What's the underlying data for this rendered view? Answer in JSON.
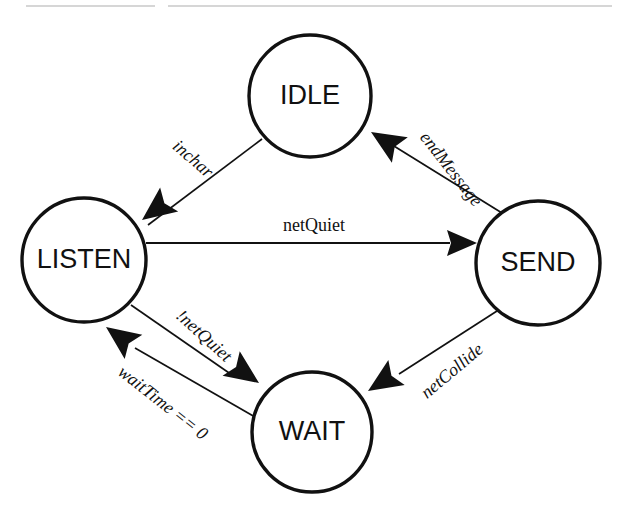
{
  "diagram": {
    "type": "finite-state-machine",
    "colors": {
      "stroke": "#111111",
      "fill": "#ffffff",
      "background": "#ffffff",
      "rule": "#c8c8c8"
    },
    "canvas": {
      "width": 627,
      "height": 517
    },
    "rules": [
      {
        "name": "top-rule-left",
        "x1": 26,
        "y1": 6,
        "x2": 155,
        "y2": 6
      },
      {
        "name": "top-rule-right",
        "x1": 168,
        "y1": 6,
        "x2": 612,
        "y2": 6
      }
    ],
    "states": [
      {
        "id": "idle",
        "label": "IDLE",
        "cx": 310,
        "cy": 96,
        "r": 61,
        "font_size": 27
      },
      {
        "id": "listen",
        "label": "LISTEN",
        "cx": 84,
        "cy": 260,
        "r": 62,
        "font_size": 27
      },
      {
        "id": "send",
        "label": "SEND",
        "cx": 538,
        "cy": 263,
        "r": 62,
        "font_size": 27
      },
      {
        "id": "wait",
        "label": "WAIT",
        "cx": 312,
        "cy": 432,
        "r": 60,
        "font_size": 27
      }
    ],
    "transitions": [
      {
        "id": "idle-to-listen",
        "from": "IDLE",
        "to": "LISTEN",
        "label": "inchar",
        "label_x": 192,
        "label_y": 160,
        "label_rotation": 41,
        "label_italic": true,
        "font_size": 18,
        "x1": 262,
        "y1": 139,
        "x2": 148,
        "y2": 225,
        "tip_x": 142,
        "tip_y": 220,
        "tip_angle": 143
      },
      {
        "id": "send-to-idle",
        "from": "SEND",
        "to": "IDLE",
        "label": "endMessage",
        "label_x": 450,
        "label_y": 170,
        "label_rotation": 52,
        "label_italic": true,
        "font_size": 18,
        "x1": 502,
        "y1": 213,
        "x2": 381,
        "y2": 138,
        "tip_x": 371,
        "tip_y": 132,
        "tip_angle": 212
      },
      {
        "id": "listen-to-send",
        "from": "LISTEN",
        "to": "SEND",
        "label": "netQuiet",
        "label_x": 314,
        "label_y": 227,
        "label_rotation": 0,
        "label_italic": false,
        "font_size": 18,
        "x1": 146,
        "y1": 243,
        "x2": 450,
        "y2": 243,
        "tip_x": 477,
        "tip_y": 243,
        "tip_angle": 0
      },
      {
        "id": "listen-to-wait",
        "from": "LISTEN",
        "to": "WAIT",
        "label": "!netQuiet",
        "label_x": 203,
        "label_y": 337,
        "label_rotation": 42,
        "label_italic": true,
        "font_size": 18,
        "x1": 131,
        "y1": 305,
        "x2": 232,
        "y2": 375,
        "tip_x": 259,
        "tip_y": 383,
        "tip_angle": 35
      },
      {
        "id": "send-to-wait",
        "from": "SEND",
        "to": "WAIT",
        "label": "netCollide",
        "label_x": 453,
        "label_y": 372,
        "label_rotation": -40,
        "label_italic": true,
        "font_size": 18,
        "x1": 497,
        "y1": 311,
        "x2": 399,
        "y2": 374,
        "tip_x": 368,
        "tip_y": 391,
        "tip_angle": 147
      },
      {
        "id": "wait-to-listen",
        "from": "WAIT",
        "to": "LISTEN",
        "label": "waitTime == 0",
        "label_x": 162,
        "label_y": 404,
        "label_rotation": 38,
        "label_italic": true,
        "font_size": 18,
        "x1": 255,
        "y1": 417,
        "x2": 135,
        "y2": 348,
        "tip_x": 106,
        "tip_y": 327,
        "tip_angle": 216
      }
    ]
  }
}
